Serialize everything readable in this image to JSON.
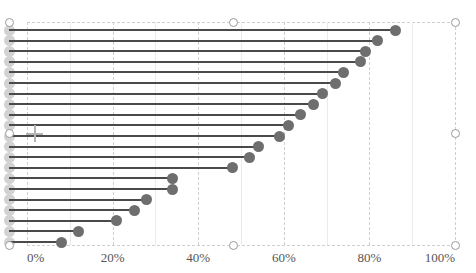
{
  "chart_data": {
    "type": "bar",
    "subtype": "lollipop-horizontal",
    "title": "",
    "subtitle": "",
    "xlabel": "",
    "ylabel": "",
    "xlim": [
      0,
      100
    ],
    "grid": true,
    "legend": null,
    "x_tick_labels": [
      "0%",
      "20%",
      "40%",
      "60%",
      "80%",
      "100%"
    ],
    "x_tick_values": [
      0,
      20,
      40,
      60,
      80,
      100
    ],
    "categories": [
      "",
      "",
      "",
      "",
      "",
      "",
      "",
      "",
      "",
      "",
      "",
      "",
      "",
      "",
      "",
      "",
      "",
      "",
      "",
      "",
      ""
    ],
    "values": [
      86,
      82,
      79,
      78,
      74,
      72,
      69,
      67,
      64,
      61,
      59,
      54,
      52,
      48,
      34,
      34,
      28,
      25,
      21,
      12,
      8
    ],
    "series": [
      {
        "name": "",
        "values": [
          86,
          82,
          79,
          78,
          74,
          72,
          69,
          67,
          64,
          61,
          59,
          54,
          52,
          48,
          34,
          34,
          28,
          25,
          21,
          12,
          8
        ]
      }
    ]
  },
  "axis": {
    "ticks": [
      {
        "label": "0%",
        "value": 0
      },
      {
        "label": "20%",
        "value": 20
      },
      {
        "label": "40%",
        "value": 40
      },
      {
        "label": "60%",
        "value": 60
      },
      {
        "label": "80%",
        "value": 80
      },
      {
        "label": "100%",
        "value": 100
      }
    ]
  },
  "colors": {
    "value_dot": "#6e6e6e",
    "origin_dot": "#d2d2d2",
    "stem": "#4a4a4a",
    "gridline": "#cfcfcf",
    "gridline_solid": "#ebebeb",
    "tick_text": "#555555",
    "handle_border": "#9a9a9a",
    "handle_fill": "#ffffff",
    "background": "#ffffff",
    "crosshair": "#b4b4b4"
  },
  "selection": {
    "handles": [
      {
        "name": "handle-top-left",
        "x": 9,
        "y": 22
      },
      {
        "name": "handle-top-center",
        "x": 233,
        "y": 22
      },
      {
        "name": "handle-top-right",
        "x": 455,
        "y": 22
      },
      {
        "name": "handle-middle-left",
        "x": 9,
        "y": 133
      },
      {
        "name": "handle-middle-right",
        "x": 455,
        "y": 133
      },
      {
        "name": "handle-bottom-left",
        "x": 9,
        "y": 245
      },
      {
        "name": "handle-bottom-center",
        "x": 233,
        "y": 245
      },
      {
        "name": "handle-bottom-right",
        "x": 455,
        "y": 245
      }
    ]
  },
  "cursor": {
    "name": "crosshair-cursor",
    "x": 34,
    "y": 133
  }
}
